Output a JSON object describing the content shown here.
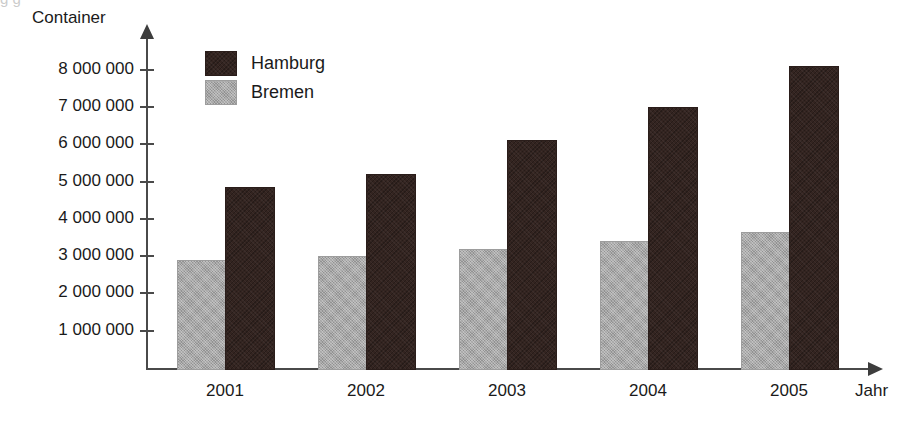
{
  "chart_data": {
    "type": "bar",
    "title": "",
    "xlabel": "Jahr",
    "ylabel": "Container",
    "categories": [
      "2001",
      "2002",
      "2003",
      "2004",
      "2005"
    ],
    "series": [
      {
        "name": "Hamburg",
        "color": "#332420",
        "values": [
          4850000,
          5200000,
          6100000,
          7000000,
          8100000
        ]
      },
      {
        "name": "Bremen",
        "color": "#a8a8a8",
        "values": [
          2900000,
          3000000,
          3200000,
          3400000,
          3650000
        ]
      }
    ],
    "ylim": [
      0,
      8600000
    ],
    "ytick_values": [
      1000000,
      2000000,
      3000000,
      4000000,
      5000000,
      6000000,
      7000000,
      8000000
    ],
    "ytick_labels": [
      "1 000 000",
      "2 000 000",
      "3 000 000",
      "4 000 000",
      "5 000 000",
      "6 000 000",
      "7 000 000",
      "8 000 000"
    ],
    "grid": false,
    "legend_position": "top-left-inside",
    "series_order_in_group": [
      "Bremen",
      "Hamburg"
    ]
  },
  "axes": {
    "y_title": "Container",
    "x_title": "Jahr"
  },
  "legend": {
    "entries": [
      {
        "label": "Hamburg",
        "color": "#332420"
      },
      {
        "label": "Bremen",
        "color": "#a8a8a8"
      }
    ]
  },
  "artifacts": {
    "top_sliver_text": "g                                                                                                                    g"
  }
}
